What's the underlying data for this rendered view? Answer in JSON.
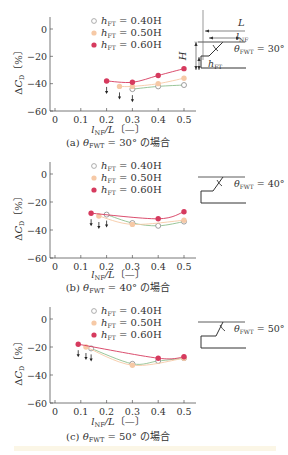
{
  "figure": {
    "x_tick_labels": [
      "0",
      "0.1",
      "0.2",
      "0.3",
      "0.4",
      "0.5"
    ],
    "y_tick_labels": [
      "0",
      "−20",
      "−40",
      "−60"
    ],
    "y_axis_label": "ΔC_D〔%〕",
    "x_axis_label": "l_NF/L〔—〕",
    "legend": [
      {
        "label_main": "h",
        "label_sub": "FT",
        "label_rest": " = 0.40H",
        "marker": "open-circle",
        "color": "#8fbf8f"
      },
      {
        "label_main": "h",
        "label_sub": "FT",
        "label_rest": " = 0.50H",
        "marker": "filled-circle",
        "color": "#f6c9a6"
      },
      {
        "label_main": "h",
        "label_sub": "FT",
        "label_rest": " = 0.60H",
        "marker": "filled-circle",
        "color": "#d63a5e"
      }
    ],
    "colors": {
      "green": "#8fbf8f",
      "orange": "#f6c9a6",
      "red": "#d63a5e",
      "axis": "#555555"
    }
  },
  "chart_data": [
    {
      "type": "line",
      "title": "(a) θFWT = 30° の場合",
      "caption_prefix": "(a)",
      "caption_theta": "θ",
      "caption_sub": "FWT",
      "caption_rest": " = 30° の場合",
      "xlabel": "l_NF/L [—]",
      "ylabel": "ΔC_D [%]",
      "xlim": [
        0,
        0.55
      ],
      "ylim": [
        -60,
        0
      ],
      "x_ticks": [
        0,
        0.1,
        0.2,
        0.3,
        0.4,
        0.5
      ],
      "y_ticks": [
        0,
        -20,
        -40,
        -60
      ],
      "grid": false,
      "legend_position": "top-center",
      "series": [
        {
          "name": "hFT = 0.40H",
          "x": [
            0.3,
            0.4,
            0.5
          ],
          "y": [
            -44,
            -42,
            -41
          ]
        },
        {
          "name": "hFT = 0.50H",
          "x": [
            0.25,
            0.3,
            0.4,
            0.5
          ],
          "y": [
            -42,
            -42,
            -40,
            -36
          ]
        },
        {
          "name": "hFT = 0.60H",
          "x": [
            0.2,
            0.3,
            0.4,
            0.5
          ],
          "y": [
            -38,
            -39,
            -34,
            -29
          ]
        }
      ],
      "arrows_x": [
        0.2,
        0.25,
        0.3
      ],
      "diagram": {
        "angle_label_theta": "θ",
        "angle_label_sub": "FWT",
        "angle_label_rest": " = 30°",
        "L": "L",
        "lNF_main": "l",
        "lNF_sub": "NF",
        "H": "H",
        "hFT_main": "h",
        "hFT_sub": "FT"
      }
    },
    {
      "type": "line",
      "title": "(b) θFWT = 40° の場合",
      "caption_prefix": "(b)",
      "caption_theta": "θ",
      "caption_sub": "FWT",
      "caption_rest": " = 40° の場合",
      "xlabel": "l_NF/L [—]",
      "ylabel": "ΔC_D [%]",
      "xlim": [
        0,
        0.55
      ],
      "ylim": [
        -60,
        0
      ],
      "x_ticks": [
        0,
        0.1,
        0.2,
        0.3,
        0.4,
        0.5
      ],
      "y_ticks": [
        0,
        -20,
        -40,
        -60
      ],
      "grid": false,
      "legend_position": "top-center",
      "series": [
        {
          "name": "hFT = 0.40H",
          "x": [
            0.2,
            0.3,
            0.4,
            0.5
          ],
          "y": [
            -29,
            -35,
            -37,
            -34
          ]
        },
        {
          "name": "hFT = 0.50H",
          "x": [
            0.17,
            0.3,
            0.5
          ],
          "y": [
            -30,
            -36,
            -33
          ]
        },
        {
          "name": "hFT = 0.60H",
          "x": [
            0.14,
            0.4,
            0.5
          ],
          "y": [
            -28,
            -32,
            -27
          ]
        }
      ],
      "arrows_x": [
        0.14,
        0.17,
        0.2
      ],
      "diagram": {
        "angle_label_theta": "θ",
        "angle_label_sub": "FWT",
        "angle_label_rest": " = 40°"
      }
    },
    {
      "type": "line",
      "title": "(c) θFWT = 50° の場合",
      "caption_prefix": "(c)",
      "caption_theta": "θ",
      "caption_sub": "FWT",
      "caption_rest": " = 50° の場合",
      "xlabel": "l_NF/L [—]",
      "ylabel": "ΔC_D [%]",
      "xlim": [
        0,
        0.55
      ],
      "ylim": [
        -60,
        0
      ],
      "x_ticks": [
        0,
        0.1,
        0.2,
        0.3,
        0.4,
        0.5
      ],
      "y_ticks": [
        0,
        -20,
        -40,
        -60
      ],
      "grid": false,
      "legend_position": "top-center",
      "series": [
        {
          "name": "hFT = 0.40H",
          "x": [
            0.14,
            0.3,
            0.4,
            0.5
          ],
          "y": [
            -21,
            -32,
            -30,
            -28
          ]
        },
        {
          "name": "hFT = 0.50H",
          "x": [
            0.12,
            0.3,
            0.5
          ],
          "y": [
            -20,
            -33,
            -28
          ]
        },
        {
          "name": "hFT = 0.60H",
          "x": [
            0.09,
            0.4,
            0.5
          ],
          "y": [
            -18,
            -28,
            -27
          ]
        }
      ],
      "arrows_x": [
        0.09,
        0.12,
        0.14
      ],
      "diagram": {
        "angle_label_theta": "θ",
        "angle_label_sub": "FWT",
        "angle_label_rest": " = 50°"
      }
    }
  ]
}
